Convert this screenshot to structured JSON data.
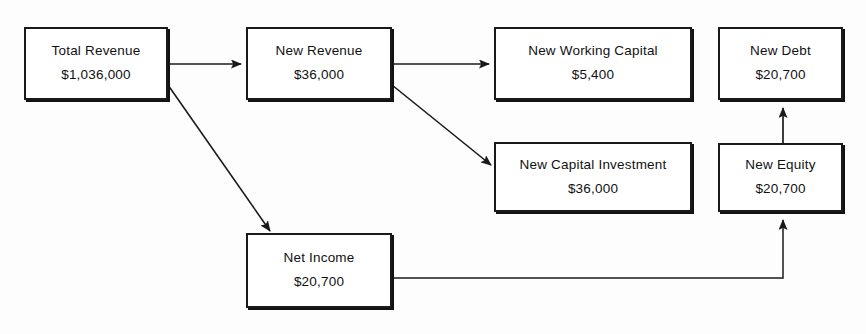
{
  "diagram": {
    "colors": {
      "background": "#fdfdfd",
      "stroke": "#1a1a1a",
      "text": "#111111"
    },
    "nodes": [
      {
        "id": "total-revenue",
        "label": "Total Revenue",
        "value": "$1,036,000",
        "x": 24,
        "y": 27,
        "w": 144,
        "h": 73
      },
      {
        "id": "new-revenue",
        "label": "New Revenue",
        "value": "$36,000",
        "x": 246,
        "y": 27,
        "w": 146,
        "h": 73
      },
      {
        "id": "new-working-capital",
        "label": "New Working Capital",
        "value": "$5,400",
        "x": 494,
        "y": 27,
        "w": 198,
        "h": 73
      },
      {
        "id": "new-debt",
        "label": "New Debt",
        "value": "$20,700",
        "x": 718,
        "y": 27,
        "w": 125,
        "h": 73
      },
      {
        "id": "new-capital-investment",
        "label": "New Capital Investment",
        "value": "$36,000",
        "x": 494,
        "y": 142,
        "w": 198,
        "h": 70
      },
      {
        "id": "new-equity",
        "label": "New Equity",
        "value": "$20,700",
        "x": 718,
        "y": 143,
        "w": 125,
        "h": 69
      },
      {
        "id": "net-income",
        "label": "Net Income",
        "value": "$20,700",
        "x": 246,
        "y": 233,
        "w": 146,
        "h": 75
      }
    ],
    "edges": [
      {
        "id": "total-revenue-to-new-revenue",
        "from": "total-revenue",
        "to": "new-revenue",
        "kind": "straight-arrow",
        "points": "168,64 240,64"
      },
      {
        "id": "total-revenue-to-net-income",
        "from": "total-revenue",
        "to": "net-income",
        "kind": "diagonal-arrow",
        "points": "168,85 268,228"
      },
      {
        "id": "new-revenue-to-new-working-capital",
        "from": "new-revenue",
        "to": "new-working-capital",
        "kind": "straight-arrow",
        "points": "392,64 488,64"
      },
      {
        "id": "new-revenue-to-new-capital-investment",
        "from": "new-revenue",
        "to": "new-capital-investment",
        "kind": "diagonal-arrow",
        "points": "392,85 489,163"
      },
      {
        "id": "net-income-to-new-equity",
        "from": "net-income",
        "to": "new-equity",
        "kind": "elbow-arrow",
        "points": "392,278 783,278 783,218"
      },
      {
        "id": "new-equity-to-new-debt",
        "from": "new-equity",
        "to": "new-debt",
        "kind": "straight-arrow-up",
        "points": "783,143 783,106"
      }
    ]
  }
}
